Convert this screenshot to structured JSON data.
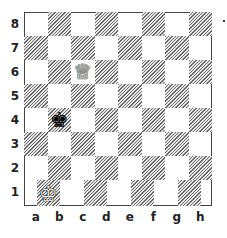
{
  "board": {
    "ranks": [
      "8",
      "7",
      "6",
      "5",
      "4",
      "3",
      "2",
      "1"
    ],
    "files": [
      "a",
      "b",
      "c",
      "d",
      "e",
      "f",
      "g",
      "h"
    ],
    "pieces": [
      {
        "name": "white-queen",
        "glyph": "♕",
        "color": "white",
        "square": "c6"
      },
      {
        "name": "black-king",
        "glyph": "♚",
        "color": "black",
        "square": "b4"
      },
      {
        "name": "white-king",
        "glyph": "♔",
        "color": "white",
        "square": "a1-b1 (offset)"
      }
    ],
    "colors": {
      "light": "#ffffff",
      "dark_hatch": "#6a6a6a",
      "border": "#444444"
    }
  }
}
